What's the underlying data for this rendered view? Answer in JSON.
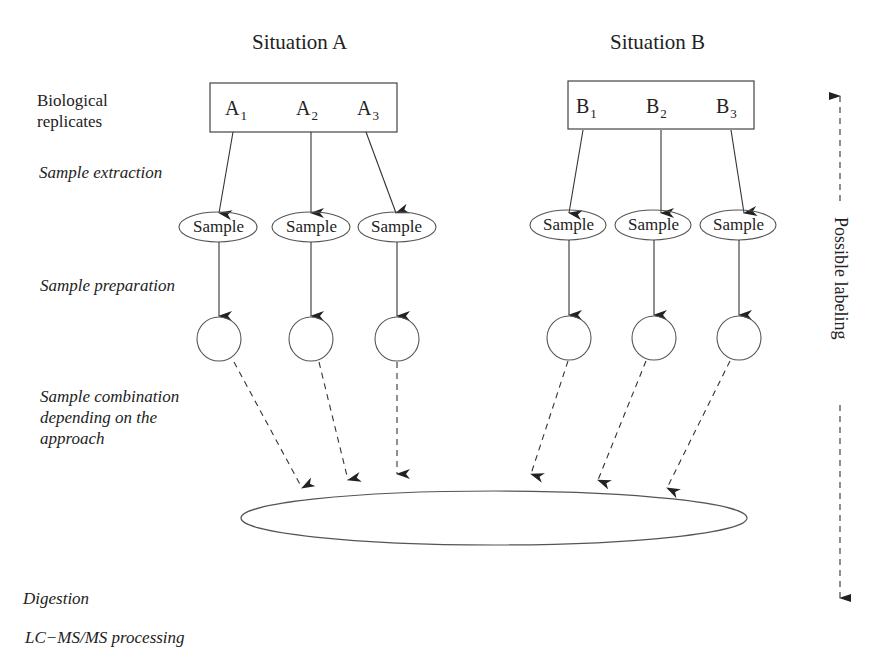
{
  "situations": {
    "a": {
      "title": "Situation A",
      "replicates": [
        {
          "letter": "A",
          "index": "1"
        },
        {
          "letter": "A",
          "index": "2"
        },
        {
          "letter": "A",
          "index": "3"
        }
      ]
    },
    "b": {
      "title": "Situation B",
      "replicates": [
        {
          "letter": "B",
          "index": "1"
        },
        {
          "letter": "B",
          "index": "2"
        },
        {
          "letter": "B",
          "index": "3"
        }
      ]
    }
  },
  "sample_label": "Sample",
  "steps": {
    "biological_replicates_line1": "Biological",
    "biological_replicates_line2": "replicates",
    "sample_extraction": "Sample extraction",
    "sample_preparation": "Sample preparation",
    "sample_combination_line1": "Sample combination",
    "sample_combination_line2": "depending on the",
    "sample_combination_line3": "approach",
    "digestion": "Digestion",
    "lcms": "LC−MS/MS processing"
  },
  "side_arrow": {
    "label": "Possible labeling"
  },
  "colors": {
    "stroke": "#333333",
    "text": "#222222",
    "background": "#ffffff"
  }
}
